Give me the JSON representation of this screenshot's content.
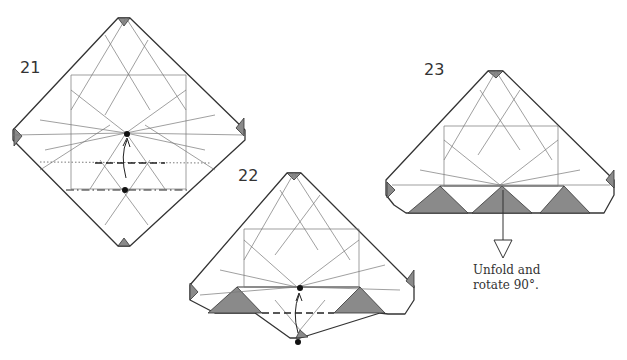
{
  "steps": [
    {
      "number": "21"
    },
    {
      "number": "22"
    },
    {
      "number": "23",
      "caption_line1": "Unfold and",
      "caption_line2": "rotate 90°."
    }
  ],
  "colors": {
    "outline": "#333333",
    "crease": "#777777",
    "shade": "#8a8a8a",
    "dot": "#111111"
  }
}
